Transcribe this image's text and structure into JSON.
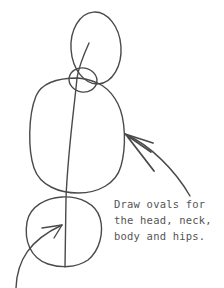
{
  "caption": {
    "lines": [
      "Draw ovals for",
      "the head, neck,",
      "body and hips."
    ]
  },
  "shapes": [
    {
      "name": "head",
      "type": "oval"
    },
    {
      "name": "neck",
      "type": "oval"
    },
    {
      "name": "body",
      "type": "oval"
    },
    {
      "name": "hips",
      "type": "oval"
    }
  ],
  "colors": {
    "stroke": "#4a4a4a",
    "text": "#555555",
    "background": "#ffffff"
  }
}
